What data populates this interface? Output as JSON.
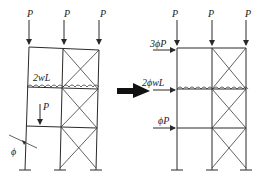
{
  "figure": {
    "left_frame": {
      "top_loads": [
        "P",
        "P",
        "P"
      ],
      "distributed_load_label": "2wL",
      "lower_load_label": "P",
      "imperfection_label": "ϕ"
    },
    "transform_arrow": "equivalent",
    "right_frame": {
      "top_loads": [
        "P",
        "P",
        "P"
      ],
      "notional_loads": [
        "3ϕP",
        "2ϕwL",
        "ϕP"
      ]
    }
  }
}
